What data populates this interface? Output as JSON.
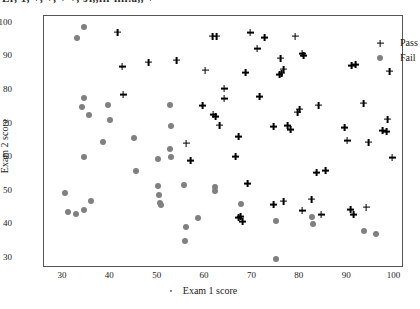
{
  "figure": {
    "cropped_title": "Lr, 1, +, +, + +, Ji,,iii-iiii.a,, +"
  },
  "axes": {
    "xlabel": "Exam 1  score",
    "ylabel": "Exam 2 score",
    "xticks": [
      "30",
      "40",
      "50",
      "60",
      "70",
      "80",
      "90",
      "100"
    ],
    "yticks": [
      "30",
      "40",
      "50",
      "60",
      "70",
      "80",
      "90",
      "100"
    ]
  },
  "legend": {
    "items": [
      {
        "label": "Pass",
        "marker": "plus-marker",
        "color": "#000000"
      },
      {
        "label": "Fail",
        "marker": "circle-marker",
        "color": "#808080"
      }
    ]
  },
  "chart_data": {
    "type": "scatter",
    "title": "",
    "xlabel": "Exam 1  score",
    "ylabel": "Exam 2 score",
    "xlim": [
      26,
      102
    ],
    "ylim": [
      27,
      102
    ],
    "grid": false,
    "legend_position": "top-right",
    "series": [
      {
        "name": "Pass",
        "marker": "plus",
        "color": "#000000",
        "points": [
          [
            41.5,
            97.2
          ],
          [
            61.6,
            96.0
          ],
          [
            62.5,
            96.0
          ],
          [
            69.5,
            97.0
          ],
          [
            72.5,
            95.5
          ],
          [
            79.0,
            96.0
          ],
          [
            71.0,
            92.2
          ],
          [
            80.5,
            90.8
          ],
          [
            80.8,
            90.3
          ],
          [
            76.0,
            89.5
          ],
          [
            54.0,
            88.9
          ],
          [
            48.0,
            88.3
          ],
          [
            42.5,
            87.0
          ],
          [
            91.0,
            87.2
          ],
          [
            91.8,
            87.6
          ],
          [
            99.0,
            85.6
          ],
          [
            60.0,
            85.9
          ],
          [
            68.5,
            85.2
          ],
          [
            76.5,
            86.2
          ],
          [
            75.8,
            84.6
          ],
          [
            76.2,
            85.0
          ],
          [
            64.0,
            80.4
          ],
          [
            71.5,
            77.9
          ],
          [
            42.7,
            78.6
          ],
          [
            64.0,
            77.3
          ],
          [
            59.5,
            75.4
          ],
          [
            84.0,
            75.5
          ],
          [
            93.5,
            76.1
          ],
          [
            80.0,
            74.3
          ],
          [
            79.5,
            73.4
          ],
          [
            61.7,
            72.6
          ],
          [
            62.3,
            72.1
          ],
          [
            98.5,
            71.3
          ],
          [
            63.0,
            69.5
          ],
          [
            74.5,
            69.1
          ],
          [
            77.5,
            69.3
          ],
          [
            78.0,
            68.2
          ],
          [
            89.5,
            68.8
          ],
          [
            97.5,
            68.0
          ],
          [
            98.3,
            67.6
          ],
          [
            56.0,
            64.2
          ],
          [
            90.0,
            65.0
          ],
          [
            94.5,
            64.5
          ],
          [
            67.0,
            66.0
          ],
          [
            66.5,
            60.2
          ],
          [
            57.0,
            59.0
          ],
          [
            99.5,
            59.8
          ],
          [
            85.5,
            56.1
          ],
          [
            83.5,
            55.5
          ],
          [
            69.0,
            52.2
          ],
          [
            82.5,
            47.5
          ],
          [
            76.5,
            46.9
          ],
          [
            74.5,
            45.8
          ],
          [
            90.8,
            44.4
          ],
          [
            94.0,
            45.1
          ],
          [
            80.5,
            44.1
          ],
          [
            91.3,
            43.0
          ],
          [
            84.5,
            42.9
          ],
          [
            67.0,
            41.9
          ],
          [
            67.5,
            42.3
          ],
          [
            68.0,
            40.8
          ]
        ]
      },
      {
        "name": "Fail",
        "marker": "circle",
        "color": "#808080",
        "points": [
          [
            34.5,
            98.8
          ],
          [
            33.0,
            95.4
          ],
          [
            34.5,
            77.7
          ],
          [
            39.5,
            75.6
          ],
          [
            34.0,
            75.0
          ],
          [
            35.5,
            72.4
          ],
          [
            52.5,
            75.4
          ],
          [
            40.0,
            70.9
          ],
          [
            52.8,
            69.2
          ],
          [
            38.5,
            64.5
          ],
          [
            45.0,
            65.8
          ],
          [
            52.5,
            62.5
          ],
          [
            52.8,
            60.1
          ],
          [
            34.5,
            60.1
          ],
          [
            50.0,
            59.4
          ],
          [
            45.5,
            55.9
          ],
          [
            30.5,
            49.4
          ],
          [
            50.0,
            51.3
          ],
          [
            55.5,
            51.6
          ],
          [
            62.0,
            51.0
          ],
          [
            62.2,
            49.8
          ],
          [
            50.3,
            48.7
          ],
          [
            50.5,
            46.3
          ],
          [
            50.7,
            45.8
          ],
          [
            36.0,
            46.9
          ],
          [
            34.5,
            44.2
          ],
          [
            31.0,
            43.8
          ],
          [
            32.8,
            43.0
          ],
          [
            67.5,
            45.9
          ],
          [
            58.5,
            41.9
          ],
          [
            75.0,
            41.0
          ],
          [
            82.5,
            42.2
          ],
          [
            82.7,
            40.1
          ],
          [
            56.0,
            39.1
          ],
          [
            93.5,
            38.1
          ],
          [
            96.0,
            37.2
          ],
          [
            55.8,
            35.1
          ],
          [
            75.0,
            29.8
          ]
        ]
      }
    ]
  }
}
